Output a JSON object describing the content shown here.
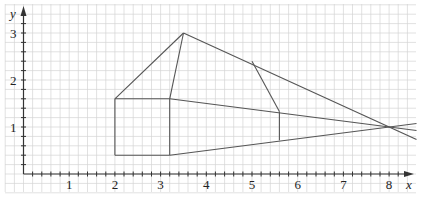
{
  "diagram": {
    "type": "perspective-drawing-on-grid",
    "axes": {
      "x_label": "x",
      "y_label": "y",
      "x_ticks": [
        "1",
        "2",
        "3",
        "4",
        "5",
        "6",
        "7",
        "8"
      ],
      "y_ticks": [
        "1",
        "2",
        "3"
      ],
      "minor_per_unit": 5
    },
    "colors": {
      "grid": "#d4d4d4",
      "axis": "#333333",
      "line": "#555555"
    },
    "points": {
      "front_bottom_left": [
        2,
        0.4
      ],
      "front_bottom_right": [
        3.2,
        0.4
      ],
      "front_top_right": [
        3.2,
        1.6
      ],
      "front_top_left": [
        2,
        1.6
      ],
      "apex": [
        3.5,
        3
      ],
      "back_apex": [
        5,
        2.4
      ],
      "back_top": [
        5.6,
        1.33
      ],
      "back_bottom": [
        5.6,
        0.72
      ],
      "vanishing_point": [
        8,
        1
      ]
    }
  }
}
